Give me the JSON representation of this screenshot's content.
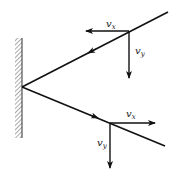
{
  "diagram": {
    "colors": {
      "stroke": "#111111",
      "hatch": "#555555",
      "background": "#ffffff"
    },
    "wall": {
      "x": 22,
      "y_top": 38,
      "y_bottom": 138,
      "hatch_side": "left"
    },
    "reflection_point": {
      "x": 22,
      "y": 87
    },
    "incoming_ray": {
      "from": {
        "x": 168,
        "y": 12
      },
      "to": {
        "x": 22,
        "y": 87
      },
      "mid_arrow": {
        "x": 92,
        "y": 51,
        "direction": "down-left"
      },
      "components_origin": {
        "x": 129,
        "y": 31
      },
      "vx": {
        "label_base": "v",
        "label_sub": "x",
        "direction": "left",
        "end": {
          "x": 85,
          "y": 31
        }
      },
      "vy": {
        "label_base": "v",
        "label_sub": "y",
        "direction": "down",
        "end": {
          "x": 129,
          "y": 78
        }
      }
    },
    "reflected_ray": {
      "from": {
        "x": 22,
        "y": 87
      },
      "to": {
        "x": 165,
        "y": 146
      },
      "mid_arrow": {
        "x": 95,
        "y": 117,
        "direction": "down-right"
      },
      "components_origin": {
        "x": 110,
        "y": 123
      },
      "vx": {
        "label_base": "v",
        "label_sub": "x",
        "direction": "right",
        "end": {
          "x": 155,
          "y": 123
        }
      },
      "vy": {
        "label_base": "v",
        "label_sub": "y",
        "direction": "down",
        "end": {
          "x": 110,
          "y": 168
        }
      }
    }
  }
}
